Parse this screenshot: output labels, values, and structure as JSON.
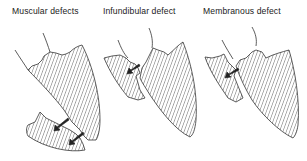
{
  "figure": {
    "panels": [
      {
        "id": "muscular",
        "title": "Muscular defects",
        "arrow_count": 2
      },
      {
        "id": "infundibular",
        "title": "Infundibular defect",
        "arrow_count": 1
      },
      {
        "id": "membranous",
        "title": "Membranous defect",
        "arrow_count": 1
      }
    ],
    "colors": {
      "line": "#333333",
      "background": "#ffffff"
    },
    "fill_style": "diagonal-hatch"
  }
}
